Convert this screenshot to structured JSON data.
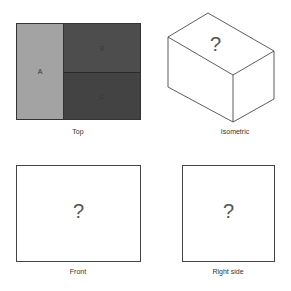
{
  "panels": {
    "top": {
      "caption": "Top",
      "regions": [
        {
          "label": "A",
          "color": "#a3a3a3",
          "text_color": "#333333"
        },
        {
          "label": "B",
          "color": "#4d4d4d",
          "text_color": "#3a3a3a"
        },
        {
          "label": "C",
          "color": "#434343",
          "text_color": "#363636"
        }
      ]
    },
    "isometric": {
      "caption": "Isometric",
      "mark": "?"
    },
    "front": {
      "caption": "Front",
      "mark": "?"
    },
    "right": {
      "caption": "Right side",
      "mark": "?"
    }
  }
}
